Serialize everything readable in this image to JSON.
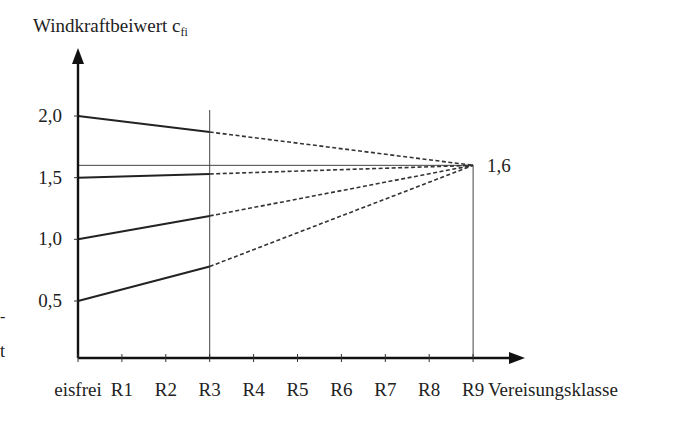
{
  "chart_data": {
    "type": "line",
    "title": "",
    "ylabel": "Windkraftbeiwert c",
    "ylabel_subscript": "fi",
    "xlabel": "Vereisungsklasse",
    "categories": [
      "eisfrei",
      "R1",
      "R2",
      "R3",
      "R4",
      "R5",
      "R6",
      "R7",
      "R8",
      "R9"
    ],
    "yticks": [
      0.5,
      1.0,
      1.5,
      2.0
    ],
    "ytick_labels": [
      "0,5",
      "1,0",
      "1,5",
      "2,0"
    ],
    "ylim": [
      0.0,
      2.3
    ],
    "grid": false,
    "reference_lines": {
      "vertical_at": [
        "R3",
        "R9"
      ],
      "horizontal_at": 1.6
    },
    "annotation": {
      "text": "1,6",
      "x": "R9",
      "y": 1.6
    },
    "series": [
      {
        "name": "c_fi start 2,0",
        "solid": {
          "x": [
            "eisfrei",
            "R3"
          ],
          "y": [
            2.0,
            1.87
          ]
        },
        "dashed": {
          "x": [
            "R3",
            "R9"
          ],
          "y": [
            1.87,
            1.6
          ]
        }
      },
      {
        "name": "c_fi start 1,5",
        "solid": {
          "x": [
            "eisfrei",
            "R3"
          ],
          "y": [
            1.5,
            1.53
          ]
        },
        "dashed": {
          "x": [
            "R3",
            "R9"
          ],
          "y": [
            1.53,
            1.6
          ]
        }
      },
      {
        "name": "c_fi start 1,0",
        "solid": {
          "x": [
            "eisfrei",
            "R3"
          ],
          "y": [
            1.0,
            1.19
          ]
        },
        "dashed": {
          "x": [
            "R3",
            "R9"
          ],
          "y": [
            1.19,
            1.6
          ]
        }
      },
      {
        "name": "c_fi start 0,5",
        "solid": {
          "x": [
            "eisfrei",
            "R3"
          ],
          "y": [
            0.5,
            0.78
          ]
        },
        "dashed": {
          "x": [
            "R3",
            "R9"
          ],
          "y": [
            0.78,
            1.6
          ]
        }
      }
    ]
  },
  "margin_fragments": [
    "-",
    "t"
  ]
}
